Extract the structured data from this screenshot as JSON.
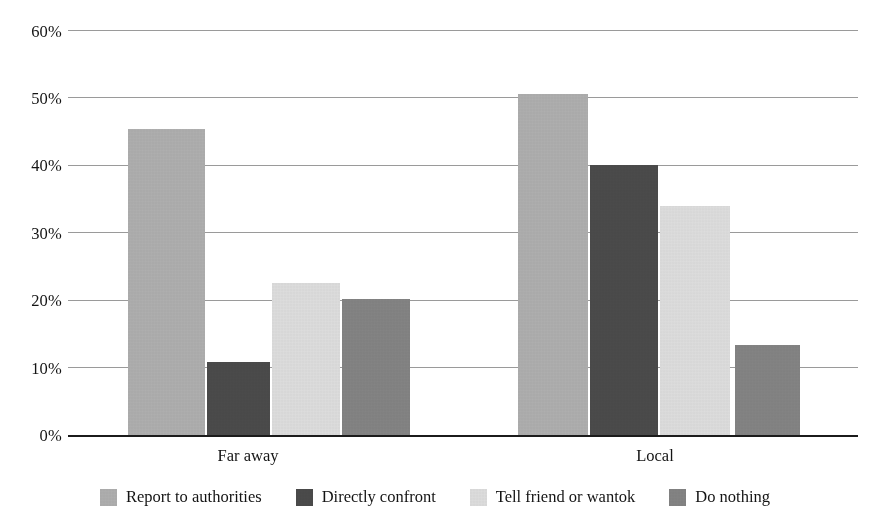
{
  "chart_data": {
    "type": "bar",
    "title": "",
    "subtitle": "",
    "xlabel": "",
    "ylabel": "",
    "categories": [
      "Far away",
      "Local"
    ],
    "series": [
      {
        "name": "Report to authorities",
        "color": "#b3b3b3",
        "values": [
          45.3,
          50.5
        ]
      },
      {
        "name": "Directly confront",
        "color": "#4d4d4d",
        "values": [
          10.8,
          40.0
        ]
      },
      {
        "name": "Tell friend or wantok",
        "color": "#e3e3e3",
        "values": [
          22.5,
          34.0
        ]
      },
      {
        "name": "Do nothing",
        "color": "#878787",
        "values": [
          20.2,
          13.4
        ]
      }
    ],
    "ylim": [
      0,
      60
    ],
    "yticks": [
      0,
      10,
      20,
      30,
      40,
      50,
      60
    ],
    "ytick_labels": [
      "0%",
      "10%",
      "20%",
      "30%",
      "40%",
      "50%",
      "60%"
    ],
    "grid": true,
    "grid_axis": "y",
    "legend_position": "bottom",
    "value_format": "percent"
  },
  "axis": {
    "y_ticks": [
      {
        "label": "60%",
        "value": 60
      },
      {
        "label": "50%",
        "value": 50
      },
      {
        "label": "40%",
        "value": 40
      },
      {
        "label": "30%",
        "value": 30
      },
      {
        "label": "20%",
        "value": 20
      },
      {
        "label": "10%",
        "value": 10
      },
      {
        "label": "0%",
        "value": 0
      }
    ],
    "x_categories": [
      {
        "label": "Far away"
      },
      {
        "label": "Local"
      }
    ]
  },
  "legend": {
    "items": [
      {
        "label": "Report to authorities",
        "color": "#b3b3b3"
      },
      {
        "label": "Directly confront",
        "color": "#4d4d4d"
      },
      {
        "label": "Tell friend or wantok",
        "color": "#e3e3e3"
      },
      {
        "label": "Do nothing",
        "color": "#878787"
      }
    ]
  },
  "colors": {
    "gridline": "#9a9a9a",
    "axis_line": "#1b1b1b",
    "text": "#141414",
    "background": "#ffffff"
  }
}
